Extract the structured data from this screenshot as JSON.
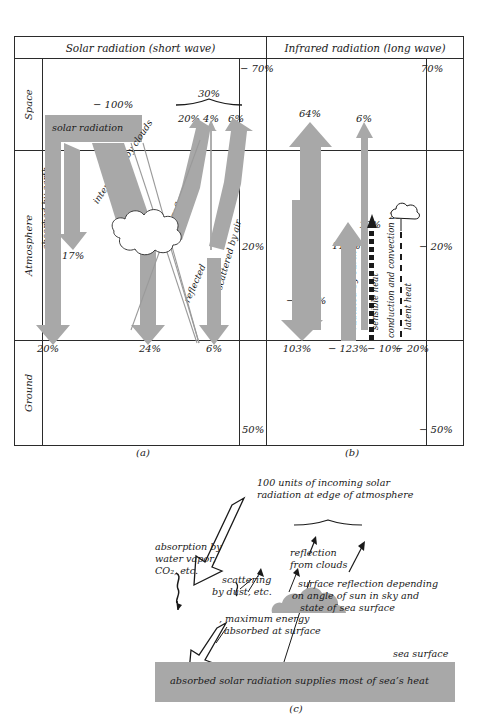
{
  "figure": {
    "panel_a_caption": "(a)",
    "panel_b_caption": "(b)",
    "panel_c_caption": "(c)"
  },
  "headers": {
    "solar": "Solar radiation (short wave)",
    "infrared": "Infrared radiation (long wave)"
  },
  "zones": {
    "space": "Space",
    "atmosphere": "Atmosphere",
    "ground": "Ground"
  },
  "panel_a": {
    "incoming_label": "− 100%",
    "incoming_band": "solar radiation",
    "brace_total": "30%",
    "top_reflected": "20%",
    "top_middle": "4%",
    "top_scattered": "6%",
    "space_balance": "− 70%",
    "atmosphere_balance": "20%",
    "absorbed_by_earth": "absorbed by earth",
    "absorbed_by_air": "absorbed by air",
    "absorbed_by_air_pct": "17%",
    "intercepted_by_clouds": "intercepted by clouds",
    "cloud_absorbed_label": "absorbed",
    "cloud_absorbed_pct": "3%",
    "reflected_wide": "reflected",
    "reflected_thin": "reflected",
    "scattered_by_air": "scattered by air",
    "ground_earth": "20%",
    "ground_clouds": "24%",
    "ground_air": "6%",
    "ground_balance": "50%"
  },
  "panel_b": {
    "space_balance": "70%",
    "radiated_by_atmosphere_top": "64%",
    "window_top": "6%",
    "radiated_by_atmosphere": "radiated by atmosphere",
    "radiated_by_atmosphere_pct": "− 167%",
    "radiated_by_earth": "radiated by earth",
    "radiated_by_earth_pct": "117%",
    "sensible_heat": "sensible heat",
    "sensible_heat_pct": "10%",
    "conduction_and_convection": "conduction and convection",
    "latent_heat": "latent heat",
    "latent_heat_pct": "20%",
    "atmosphere_balance": "− 20%",
    "ground_atmosphere": "103%",
    "ground_earth": "− 123%",
    "ground_sensible": "− 10%",
    "ground_latent": "− 20%",
    "ground_balance": "− 50%"
  },
  "panel_c": {
    "incoming": "100 units of incoming solar\nradiation at edge of atmosphere",
    "incoming_line1": "100 units of incoming solar",
    "incoming_line2": "radiation at edge of atmosphere",
    "absorption_line1": "absorption by",
    "absorption_line2": "water vapor,",
    "absorption_line3": "CO₂, etc.",
    "scattering_line1": "scattering",
    "scattering_line2": "by dust, etc.",
    "reflection_line1": "reflection",
    "reflection_line2": "from clouds",
    "surface_reflection_line1": "surface reflection depending",
    "surface_reflection_line2": "on angle of sun in sky and",
    "surface_reflection_line3": "state of sea surface",
    "max_energy_line1": ", maximum energy",
    "max_energy_line2": "absorbed at surface",
    "sea_surface": "sea surface",
    "sea_band": "absorbed solar radiation supplies most of sea’s heat"
  },
  "colors": {
    "fill_grey": "#a8a8a8",
    "line_dark": "#2b2b2b",
    "line_thin": "#6e6e6e",
    "text": "#1a1a1a",
    "background": "#ffffff"
  }
}
